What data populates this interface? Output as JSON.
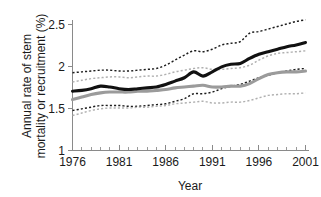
{
  "figure": {
    "background_color": "#ffffff",
    "width": 321,
    "height": 197
  },
  "axis": {
    "x_title": "Year",
    "y_title_line1": "Annual rate of stem",
    "y_title_line2": "mortality or recruitment (%)",
    "y_tick_labels": [
      "2.5",
      "2",
      "1.5",
      "1"
    ],
    "x_tick_labels": [
      "1976",
      "1981",
      "1986",
      "1991",
      "1996",
      "2001"
    ]
  },
  "colors": {
    "mortality_line": "#111111",
    "recruitment_line": "#9b9b9b",
    "mortality_ci": "#1d1d1d",
    "recruitment_ci": "#b0b0b0",
    "axis": "#8a8a8a",
    "text": "#1a1a1a"
  },
  "chart_data": {
    "type": "line",
    "title": "",
    "xlabel": "Year",
    "ylabel": "Annual rate of stem mortality or recruitment (%)",
    "xlim": [
      1976,
      2001
    ],
    "ylim": [
      1,
      2.6
    ],
    "yticks": [
      1,
      1.5,
      2,
      2.5
    ],
    "ytick_labels": [
      "1",
      "1.5",
      "2",
      "2.5"
    ],
    "xticks": [
      1976,
      1981,
      1986,
      1991,
      1996,
      2001
    ],
    "xtick_labels": [
      "1976",
      "1981",
      "1986",
      "1991",
      "1996",
      "2001"
    ],
    "minor_xticks_every": 1,
    "grid": false,
    "legend": null,
    "x": [
      1976,
      1977,
      1978,
      1979,
      1980,
      1981,
      1982,
      1983,
      1984,
      1985,
      1986,
      1987,
      1988,
      1989,
      1990,
      1991,
      1992,
      1993,
      1994,
      1995,
      1996,
      1997,
      1998,
      1999,
      2000,
      2001
    ],
    "series": [
      {
        "name": "Stem mortality (solid black)",
        "style": "solid",
        "color": "#111111",
        "values": [
          1.7,
          1.71,
          1.73,
          1.76,
          1.75,
          1.73,
          1.72,
          1.73,
          1.74,
          1.75,
          1.78,
          1.82,
          1.86,
          1.93,
          1.88,
          1.93,
          1.99,
          2.02,
          2.03,
          2.09,
          2.14,
          2.17,
          2.2,
          2.23,
          2.25,
          2.28
        ]
      },
      {
        "name": "Stem mortality upper 95% CI (dashed black)",
        "style": "dashed",
        "color": "#1d1d1d",
        "values": [
          1.92,
          1.93,
          1.94,
          1.95,
          1.95,
          1.94,
          1.94,
          1.95,
          1.96,
          1.97,
          2.01,
          2.07,
          2.13,
          2.18,
          2.17,
          2.2,
          2.25,
          2.27,
          2.29,
          2.39,
          2.41,
          2.44,
          2.47,
          2.5,
          2.53,
          2.55
        ]
      },
      {
        "name": "Stem mortality lower 95% CI (dashed black)",
        "style": "dashed",
        "color": "#1d1d1d",
        "values": [
          1.47,
          1.49,
          1.51,
          1.53,
          1.53,
          1.53,
          1.52,
          1.52,
          1.53,
          1.54,
          1.55,
          1.58,
          1.61,
          1.67,
          1.67,
          1.69,
          1.73,
          1.76,
          1.78,
          1.82,
          1.86,
          1.89,
          1.92,
          1.94,
          1.96,
          1.97
        ]
      },
      {
        "name": "Stem recruitment (solid grey)",
        "style": "solid",
        "color": "#9b9b9b",
        "values": [
          1.6,
          1.63,
          1.66,
          1.68,
          1.69,
          1.69,
          1.69,
          1.7,
          1.7,
          1.71,
          1.72,
          1.74,
          1.75,
          1.76,
          1.77,
          1.75,
          1.75,
          1.76,
          1.76,
          1.79,
          1.85,
          1.9,
          1.92,
          1.93,
          1.93,
          1.94
        ]
      },
      {
        "name": "Stem recruitment upper 95% CI (dashed grey)",
        "style": "dashed",
        "color": "#b0b0b0",
        "values": [
          1.81,
          1.83,
          1.85,
          1.86,
          1.87,
          1.87,
          1.86,
          1.87,
          1.88,
          1.88,
          1.9,
          1.93,
          1.95,
          1.97,
          1.98,
          1.96,
          1.96,
          1.97,
          1.98,
          2.01,
          2.07,
          2.12,
          2.15,
          2.16,
          2.17,
          2.18
        ]
      },
      {
        "name": "Stem recruitment lower 95% CI (dashed grey)",
        "style": "dashed",
        "color": "#b0b0b0",
        "values": [
          1.41,
          1.44,
          1.47,
          1.49,
          1.5,
          1.5,
          1.5,
          1.51,
          1.51,
          1.52,
          1.53,
          1.55,
          1.56,
          1.57,
          1.58,
          1.56,
          1.56,
          1.57,
          1.57,
          1.59,
          1.62,
          1.65,
          1.66,
          1.67,
          1.67,
          1.68
        ]
      }
    ]
  }
}
